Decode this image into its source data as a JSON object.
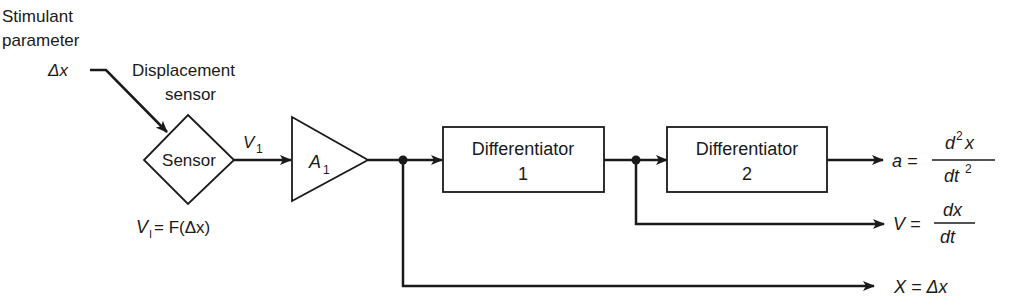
{
  "labels": {
    "stimulant_line1": "Stimulant",
    "stimulant_line2": "parameter",
    "delta_x": "Δx",
    "displacement_line1": "Displacement",
    "displacement_line2": "sensor",
    "v1_signal": "V",
    "v1_sub": "1",
    "v1_eq_lhs": "V",
    "v1_eq_sub": "I",
    "v1_eq_rhs": " = F(Δx)"
  },
  "blocks": {
    "sensor": {
      "label": "Sensor"
    },
    "amplifier": {
      "label": "A",
      "sub": "1"
    },
    "diff1": {
      "line1": "Differentiator",
      "line2": "1"
    },
    "diff2": {
      "line1": "Differentiator",
      "line2": "2"
    }
  },
  "outputs": {
    "acceleration": {
      "lhs": "a =",
      "num": "d",
      "num_sup": "2",
      "num_tail": "x",
      "den": "dt",
      "den_sup": "2"
    },
    "velocity": {
      "lhs": "V =",
      "num": "dx",
      "den": "dt"
    },
    "displacement": {
      "text": "X = Δx"
    }
  },
  "colors": {
    "stroke": "#1a1a1a",
    "background": "#ffffff"
  }
}
